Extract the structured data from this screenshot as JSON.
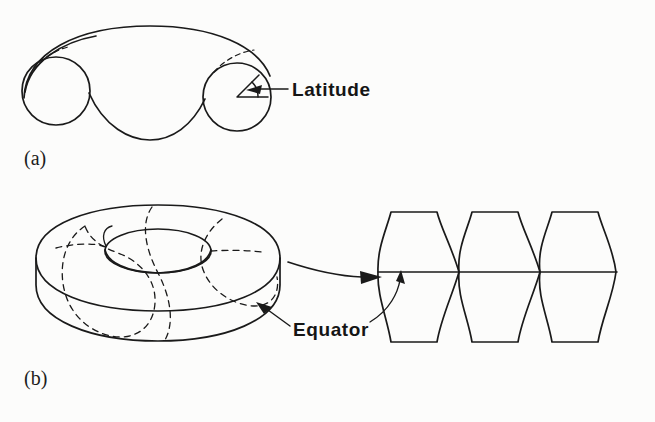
{
  "figure": {
    "background_color": "#fcfcfb",
    "ink_color": "#1a1a1a",
    "width": 655,
    "height": 422,
    "panels": [
      {
        "id": "a",
        "label": "(a)",
        "description": "cut-open torus tube showing two circular cross sections",
        "annotation": {
          "name": "latitude-callout",
          "text": "Latitude",
          "points_to": "angle-wedge-in-right-cross-section"
        }
      },
      {
        "id": "b",
        "label": "(b)",
        "description": "solid torus with dashed meridians, unrolled into three gores",
        "annotation": {
          "name": "equator-callout",
          "text": "Equator",
          "points_to": "equator-line-on-torus-and-gores"
        }
      }
    ]
  },
  "labels": {
    "panel_a": "(a)",
    "panel_b": "(b)",
    "latitude": "Latitude",
    "equator": "Equator"
  },
  "icons": {
    "latitude_arrow": "arrow-left-icon",
    "equator_arrow": "arrow-up-left-icon",
    "transform_arrow": "arrow-right-icon"
  },
  "geometry": {
    "panel_a": {
      "left_circle": {
        "cx": 56,
        "cy": 91,
        "r": 34
      },
      "right_circle": {
        "cx": 237,
        "cy": 97,
        "r": 34
      },
      "angle_wedge": {
        "vertex_x": 237,
        "vertex_y": 97,
        "arm_length": 30,
        "angle_deg": 45
      }
    },
    "panel_b": {
      "torus_outer": {
        "cx": 158,
        "cy": 268,
        "rx": 122,
        "ry": 63
      },
      "torus_hole": {
        "cx": 158,
        "cy": 250,
        "rx": 52,
        "ry": 22
      },
      "meridian_count": 4,
      "equator_y": 272
    },
    "gores": {
      "count": 3,
      "top_y": 212,
      "bottom_y": 342,
      "waist_x": [
        378,
        460,
        540,
        617
      ],
      "flat_top_inset": 22,
      "equator_y": 272
    }
  }
}
